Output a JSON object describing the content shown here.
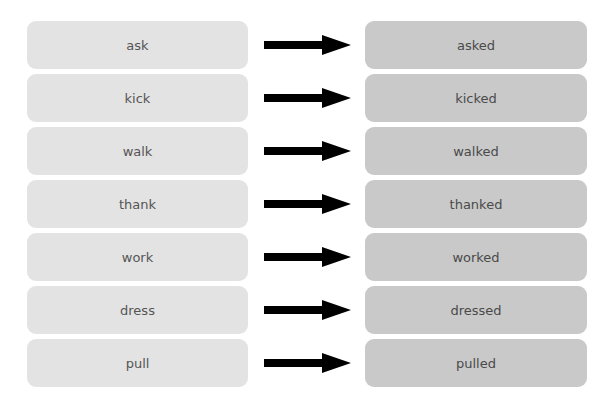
{
  "diagram": {
    "title": "",
    "pairs": [
      {
        "base": "ask",
        "past": "asked"
      },
      {
        "base": "kick",
        "past": "kicked"
      },
      {
        "base": "walk",
        "past": "walked"
      },
      {
        "base": "thank",
        "past": "thanked"
      },
      {
        "base": "work",
        "past": "worked"
      },
      {
        "base": "dress",
        "past": "dressed"
      },
      {
        "base": "pull",
        "past": "pulled"
      }
    ],
    "colors": {
      "base_box": "#e3e3e3",
      "past_box": "#c9c9c9",
      "arrow": "#000000",
      "text": "#555555"
    }
  }
}
